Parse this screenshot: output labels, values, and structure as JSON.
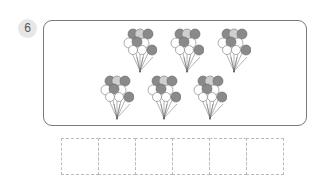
{
  "question": {
    "number": "6"
  },
  "picture": {
    "subject": "balloon bunches",
    "bunch_count": 6,
    "rows": [
      {
        "bunches": 3
      },
      {
        "bunches": 3
      }
    ],
    "colors": {
      "dark": "#8a8a8a",
      "light": "#c8c8c8",
      "outline": "#777777",
      "white": "#ffffff"
    }
  },
  "answer_grid": {
    "cells": [
      "",
      "",
      "",
      "",
      "",
      ""
    ]
  }
}
